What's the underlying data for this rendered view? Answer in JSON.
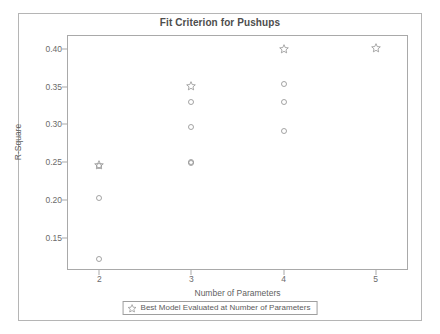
{
  "chart_data": {
    "type": "scatter",
    "title": "Fit Criterion for Pushups",
    "xlabel": "Number of Parameters",
    "ylabel": "R-Square",
    "xlim": [
      1.65,
      5.35
    ],
    "ylim": [
      0.108,
      0.418
    ],
    "grid": false,
    "xticks": [
      2,
      3,
      4,
      5
    ],
    "xtick_labels": [
      "2",
      "3",
      "4",
      "5"
    ],
    "yticks": [
      0.4,
      0.35,
      0.3,
      0.25,
      0.2,
      0.15
    ],
    "ytick_labels": [
      "0.40",
      "0.35",
      "0.30",
      "0.25",
      "0.20",
      "0.15"
    ],
    "legend_position": "below-axis",
    "series": [
      {
        "name": "Model Evaluated at Number of Parameters",
        "marker": "circle",
        "points": [
          {
            "x": 2,
            "y": 0.245
          },
          {
            "x": 2,
            "y": 0.203
          },
          {
            "x": 2,
            "y": 0.122
          },
          {
            "x": 3,
            "y": 0.329
          },
          {
            "x": 3,
            "y": 0.296
          },
          {
            "x": 3,
            "y": 0.251
          },
          {
            "x": 3,
            "y": 0.249
          },
          {
            "x": 4,
            "y": 0.354
          },
          {
            "x": 4,
            "y": 0.33
          },
          {
            "x": 4,
            "y": 0.292
          }
        ]
      },
      {
        "name": "Best Model Evaluated at Number of Parameters",
        "marker": "star",
        "points": [
          {
            "x": 2,
            "y": 0.247
          },
          {
            "x": 3,
            "y": 0.351
          },
          {
            "x": 4,
            "y": 0.4
          },
          {
            "x": 5,
            "y": 0.401
          }
        ]
      }
    ]
  },
  "legend": {
    "star_icon": "star-icon",
    "label": "Best Model Evaluated at Number of Parameters"
  },
  "colors": {
    "marker": "#9a9a9a",
    "axis": "#a9a9a9",
    "frame": "#b5b5b5",
    "title_text": "#4d4d4d",
    "tick_text": "#6b6b6b",
    "background": "#ffffff"
  }
}
